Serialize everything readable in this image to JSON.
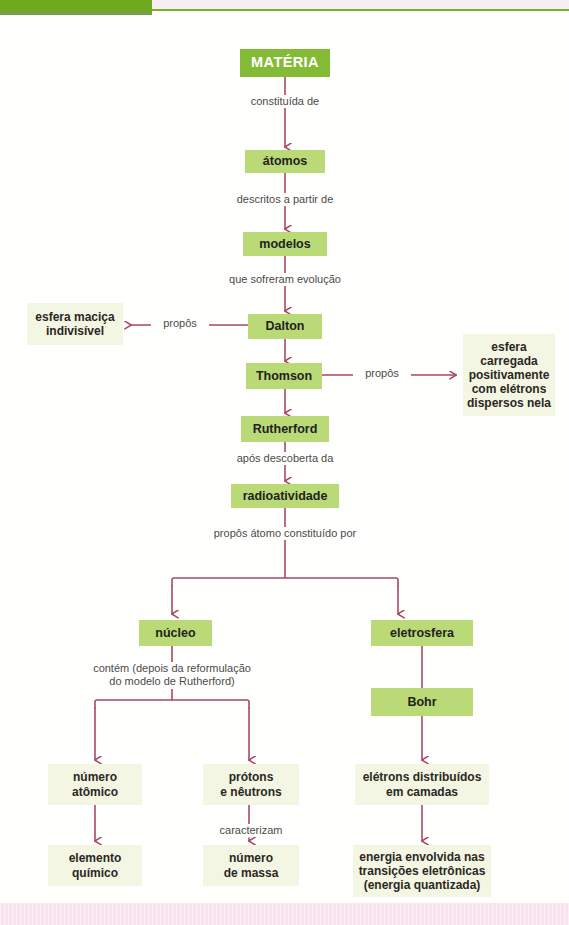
{
  "page": {
    "kind": "concept-map",
    "language": "pt-BR",
    "accent_green_dark": "#6faa1e",
    "accent_green_title": "#84bb36",
    "accent_green_node": "#b9da76",
    "accent_cream_node": "#f3f6e2",
    "accent_connector": "#a84a63",
    "accent_pink_band": "#f9e4ee"
  },
  "nodes": {
    "materia": "MATÉRIA",
    "atomos": "átomos",
    "modelos": "modelos",
    "dalton": "Dalton",
    "thomson": "Thomson",
    "rutherford": "Rutherford",
    "radioatividade": "radioatividade",
    "esfera_macica": "esfera maciça\nindivisível",
    "esfera_carregada": "esfera\ncarregada\npositivamente\ncom elétrons\ndispersos nela",
    "nucleo": "núcleo",
    "eletrosfera": "eletrosfera",
    "bohr": "Bohr",
    "numero_atomico": "número\natômico",
    "protons_neutrons": "prótons\ne nêutrons",
    "elemento_quimico": "elemento\nquímico",
    "numero_massa": "número\nde massa",
    "eletrons_camadas": "elétrons distribuídos\nem camadas",
    "energia_transicoes": "energia envolvida nas\ntransições eletrônicas\n(energia quantizada)"
  },
  "captions": {
    "constituida_de": "constituída de",
    "descritos_a_partir_de": "descritos a partir de",
    "que_sofreram_evolucao": "que sofreram evolução",
    "propos_dalton": "propôs",
    "propos_thomson": "propôs",
    "apos_descoberta_da": "após descoberta da",
    "propos_atomo_constituido": "propôs átomo constituído por",
    "contem_reformulacao": "contém (depois da reformulação\ndo modelo de Rutherford)",
    "caracterizam": "caracterizam"
  }
}
